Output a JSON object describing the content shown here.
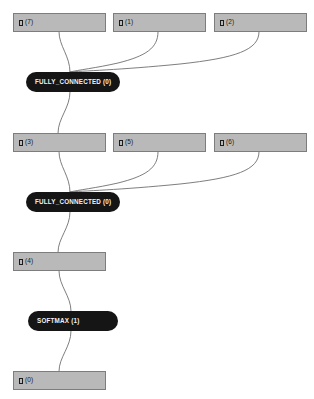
{
  "graph": {
    "title": "Model Graph",
    "background_color": "#ffffff",
    "tensor_fill_color": "#b9b9b9",
    "tensor_border_color": "#7d7d7d",
    "operator_fill_color": "#151515",
    "operator_text_color": "#f2f2f2",
    "edge_color": "#6f6f6f",
    "nodes": [
      {
        "id": "tensor-7",
        "kind": "tensor",
        "label": "□ (7)",
        "index": "7",
        "x": 13,
        "y": 13,
        "width": 93,
        "height": 19
      },
      {
        "id": "tensor-1",
        "kind": "tensor",
        "label": "□ (1)",
        "index": "1",
        "x": 113,
        "y": 13,
        "width": 93,
        "height": 19
      },
      {
        "id": "tensor-2",
        "kind": "tensor",
        "label": "□ (2)",
        "index": "2",
        "x": 214,
        "y": 13,
        "width": 93,
        "height": 19
      },
      {
        "id": "op-fully-connected-0",
        "kind": "operator",
        "label": "FULLY_CONNECTED (0)",
        "operator": "FULLY_CONNECTED",
        "index": "0",
        "x": 26,
        "y": 72,
        "width": 94,
        "height": 20
      },
      {
        "id": "tensor-3",
        "kind": "tensor",
        "label": "□ (3)",
        "index": "3",
        "x": 13,
        "y": 133,
        "width": 93,
        "height": 19
      },
      {
        "id": "tensor-5",
        "kind": "tensor",
        "label": "□ (5)",
        "index": "5",
        "x": 113,
        "y": 133,
        "width": 93,
        "height": 19
      },
      {
        "id": "tensor-6",
        "kind": "tensor",
        "label": "□ (6)",
        "index": "6",
        "x": 214,
        "y": 133,
        "width": 93,
        "height": 19
      },
      {
        "id": "op-fully-connected-1",
        "kind": "operator",
        "label": "FULLY_CONNECTED (0)",
        "operator": "FULLY_CONNECTED",
        "index": "0",
        "x": 26,
        "y": 192,
        "width": 94,
        "height": 20
      },
      {
        "id": "tensor-4",
        "kind": "tensor",
        "label": "□ (4)",
        "index": "4",
        "x": 13,
        "y": 252,
        "width": 93,
        "height": 19
      },
      {
        "id": "op-softmax-1",
        "kind": "operator",
        "label": "SOFTMAX (1)",
        "operator": "SOFTMAX",
        "index": "1",
        "x": 28,
        "y": 311,
        "width": 90,
        "height": 20
      },
      {
        "id": "tensor-0",
        "kind": "tensor",
        "label": "□ (0)",
        "index": "0",
        "x": 13,
        "y": 371,
        "width": 93,
        "height": 19
      }
    ],
    "edges": [
      {
        "id": "edge-7-to-fc0",
        "from": "tensor-7",
        "to": "op-fully-connected-0",
        "path": "M 59 32 C 59 46, 70 56, 70 72"
      },
      {
        "id": "edge-1-to-fc0",
        "from": "tensor-1",
        "to": "op-fully-connected-0",
        "path": "M 158 32 C 158 48, 146 56, 118 63 C 96 68, 78 70, 70 72"
      },
      {
        "id": "edge-2-to-fc0",
        "from": "tensor-2",
        "to": "op-fully-connected-0",
        "path": "M 259 32 C 259 50, 236 58, 180 64 C 120 70, 80 71, 70 72"
      },
      {
        "id": "edge-fc0-to-3",
        "from": "op-fully-connected-0",
        "to": "tensor-3",
        "path": "M 70 92 C 70 108, 58 118, 58 133"
      },
      {
        "id": "edge-3-to-fc1",
        "from": "tensor-3",
        "to": "op-fully-connected-1",
        "path": "M 59 152 C 59 166, 70 176, 70 192"
      },
      {
        "id": "edge-5-to-fc1",
        "from": "tensor-5",
        "to": "op-fully-connected-1",
        "path": "M 158 152 C 158 168, 146 176, 118 183 C 96 188, 78 190, 70 192"
      },
      {
        "id": "edge-6-to-fc1",
        "from": "tensor-6",
        "to": "op-fully-connected-1",
        "path": "M 259 152 C 259 170, 236 178, 180 184 C 120 190, 80 191, 70 192"
      },
      {
        "id": "edge-fc1-to-4",
        "from": "op-fully-connected-1",
        "to": "tensor-4",
        "path": "M 70 212 C 70 228, 58 238, 58 252"
      },
      {
        "id": "edge-4-to-softmax",
        "from": "tensor-4",
        "to": "op-softmax-1",
        "path": "M 59 271 C 59 286, 71 296, 71 311"
      },
      {
        "id": "edge-softmax-to-0",
        "from": "op-softmax-1",
        "to": "tensor-0",
        "path": "M 71 331 C 71 347, 59 357, 59 371"
      }
    ]
  }
}
